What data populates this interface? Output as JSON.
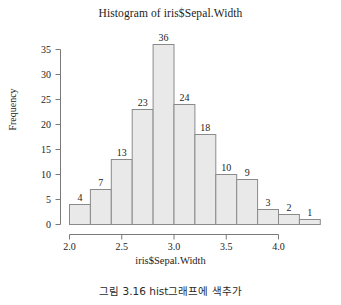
{
  "chart_data": {
    "type": "bar",
    "title": "Histogram of iris$Sepal.Width",
    "xlabel": "iris$Sepal.Width",
    "ylabel": "Frequency",
    "bin_width": 0.2,
    "bin_starts": [
      2.0,
      2.2,
      2.4,
      2.6,
      2.8,
      3.0,
      3.2,
      3.4,
      3.6,
      3.8,
      4.0,
      4.2
    ],
    "bin_ends": [
      2.2,
      2.4,
      2.6,
      2.8,
      3.0,
      3.2,
      3.4,
      3.6,
      3.8,
      4.0,
      4.2,
      4.4
    ],
    "categories": [
      "2.0-2.2",
      "2.2-2.4",
      "2.4-2.6",
      "2.6-2.8",
      "2.8-3.0",
      "3.0-3.2",
      "3.2-3.4",
      "3.4-3.6",
      "3.6-3.8",
      "3.8-4.0",
      "4.0-4.2",
      "4.2-4.4"
    ],
    "values": [
      4,
      7,
      13,
      23,
      36,
      24,
      18,
      10,
      9,
      3,
      2,
      1
    ],
    "bar_labels": [
      "4",
      "7",
      "13",
      "23",
      "36",
      "24",
      "18",
      "10",
      "9",
      "3",
      "2",
      "1"
    ],
    "xlim": [
      2.0,
      4.4
    ],
    "ylim": [
      0,
      36
    ],
    "xticks": [
      2.0,
      2.5,
      3.0,
      3.5,
      4.0
    ],
    "xtick_labels": [
      "2.0",
      "2.5",
      "3.0",
      "3.5",
      "4.0"
    ],
    "yticks": [
      0,
      5,
      10,
      15,
      20,
      25,
      30,
      35
    ],
    "ytick_labels": [
      "0",
      "5",
      "10",
      "15",
      "20",
      "25",
      "30",
      "35"
    ],
    "grid": false,
    "legend": false,
    "bar_fill": "#e9e9e9",
    "bar_stroke": "#8a8a8a",
    "axis_color": "#7a7a7a"
  },
  "caption": {
    "text": "그림 3.16 hist그래프에 색추가"
  }
}
